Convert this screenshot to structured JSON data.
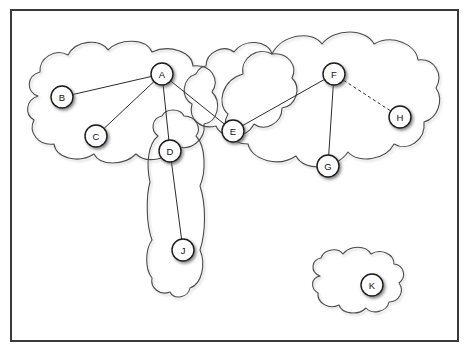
{
  "diagram": {
    "frame": {
      "x": 11,
      "y": 10,
      "width": 447,
      "height": 331,
      "stroke_color": "#3a3a3a"
    },
    "background_color": "#ffffff",
    "node_fill_color": "#ffffff",
    "node_stroke_color": "#1a1a1a",
    "edge_color": "#2b2b2b",
    "cloud_stroke_color": "#4a4a4a"
  },
  "nodes": [
    {
      "id": "A",
      "label": "A",
      "cx": 162,
      "cy": 74,
      "r": 11
    },
    {
      "id": "B",
      "label": "B",
      "cx": 62,
      "cy": 97,
      "r": 11
    },
    {
      "id": "C",
      "label": "C",
      "cx": 96,
      "cy": 136,
      "r": 11
    },
    {
      "id": "D",
      "label": "D",
      "cx": 170,
      "cy": 151,
      "r": 11
    },
    {
      "id": "E",
      "label": "E",
      "cx": 233,
      "cy": 131,
      "r": 11
    },
    {
      "id": "F",
      "label": "F",
      "cx": 334,
      "cy": 74,
      "r": 11
    },
    {
      "id": "G",
      "label": "G",
      "cx": 328,
      "cy": 166,
      "r": 11
    },
    {
      "id": "H",
      "label": "H",
      "cx": 400,
      "cy": 117,
      "r": 11
    },
    {
      "id": "J",
      "label": "J",
      "cx": 183,
      "cy": 250,
      "r": 11
    },
    {
      "id": "K",
      "label": "K",
      "cx": 372,
      "cy": 285,
      "r": 11
    }
  ],
  "edges": [
    {
      "id": "A-B",
      "from": "A",
      "to": "B",
      "style": "solid"
    },
    {
      "id": "A-C",
      "from": "A",
      "to": "C",
      "style": "solid"
    },
    {
      "id": "A-D",
      "from": "A",
      "to": "D",
      "style": "solid"
    },
    {
      "id": "A-E",
      "from": "A",
      "to": "E",
      "style": "solid"
    },
    {
      "id": "E-F",
      "from": "E",
      "to": "F",
      "style": "solid"
    },
    {
      "id": "F-G",
      "from": "F",
      "to": "G",
      "style": "solid"
    },
    {
      "id": "F-H",
      "from": "F",
      "to": "H",
      "style": "dashed"
    },
    {
      "id": "D-J",
      "from": "D",
      "to": "J",
      "style": "solid"
    }
  ],
  "clouds": [
    {
      "id": "cloud-left",
      "name": "left-cloud",
      "contains": [
        "A",
        "B",
        "C",
        "D"
      ]
    },
    {
      "id": "cloud-middle",
      "name": "middle-cloud",
      "contains": [
        "E"
      ]
    },
    {
      "id": "cloud-right",
      "name": "right-cloud",
      "contains": [
        "F",
        "G",
        "H"
      ]
    },
    {
      "id": "cloud-dj",
      "name": "vertical-cloud",
      "contains": [
        "D",
        "J"
      ]
    },
    {
      "id": "cloud-k",
      "name": "isolated-cloud",
      "contains": [
        "K"
      ]
    }
  ]
}
